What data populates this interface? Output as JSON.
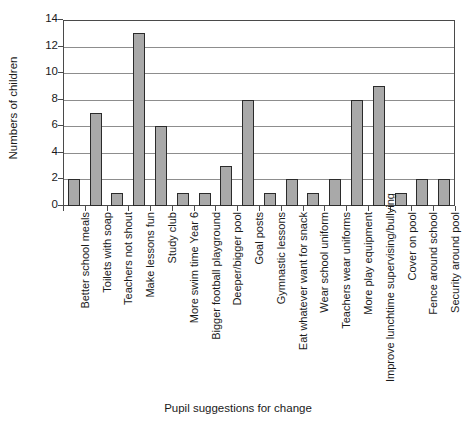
{
  "chart_data": {
    "type": "bar",
    "title": "",
    "xlabel": "Pupil suggestions for change",
    "ylabel": "Numbers of children",
    "ylim": [
      0,
      14
    ],
    "ytick_step": 2,
    "yticks": [
      0,
      2,
      4,
      6,
      8,
      10,
      12,
      14
    ],
    "grid": "horizontal",
    "legend": "none",
    "bar_fill_color": "#a9a9a9",
    "bar_border_color": "#2b2b2b",
    "categories": [
      "Better  school meals",
      "Toilets with soap",
      "Teachers not shout",
      "Make lessons fun",
      "Study club",
      "More swim time Year 6",
      "Bigger football playground",
      "Deeper/bigger pool",
      "Goal posts",
      "Gymnastic lessons",
      "Eat whatever want for snack",
      "Wear school uniform",
      "Teachers wear uniforms",
      "More play equipment",
      "Improve lunchtime supervising/bullying",
      "Cover on pool",
      "Fence around school",
      "Security around pool"
    ],
    "values": [
      2,
      7,
      1,
      13,
      6,
      1,
      1,
      3,
      8,
      1,
      2,
      1,
      2,
      8,
      9,
      1,
      2,
      2
    ]
  }
}
